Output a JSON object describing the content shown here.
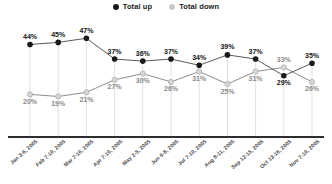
{
  "legend": {
    "items": [
      {
        "label": "Total up",
        "color": "#1a1a1a",
        "marker": "filled-circle-icon"
      },
      {
        "label": "Total down",
        "color": "#c9c9c9",
        "marker": "hollow-circle-icon"
      }
    ]
  },
  "axis": {
    "categories": [
      "Jan 3-6, 2005",
      "Feb 7-10, 2005",
      "Mar 7-10, 2005",
      "Apr 7-10, 2005",
      "May 2-5, 2005",
      "Jun 6-8, 2005",
      "Jul 7-10, 2005",
      "Aug 8-11, 2005",
      "Sep 12-15, 2005",
      "Oct 13-16, 2005",
      "Nov 7-10, 2005"
    ]
  },
  "point_labels": {
    "up": [
      "44%",
      "45%",
      "47%",
      "37%",
      "36%",
      "37%",
      "34%",
      "39%",
      "37%",
      "29%",
      "35%"
    ],
    "down": [
      "20%",
      "19%",
      "21%",
      "27%",
      "30%",
      "26%",
      "31%",
      "25%",
      "31%",
      "33%",
      "26%"
    ]
  },
  "chart_data": {
    "type": "line",
    "title": "",
    "xlabel": "",
    "ylabel": "",
    "ylim": [
      0,
      50
    ],
    "grid": "vertical-only",
    "legend_position": "top-center",
    "value_labels": "percent",
    "categories": [
      "Jan 3-6, 2005",
      "Feb 7-10, 2005",
      "Mar 7-10, 2005",
      "Apr 7-10, 2005",
      "May 2-5, 2005",
      "Jun 6-8, 2005",
      "Jul 7-10, 2005",
      "Aug 8-11, 2005",
      "Sep 12-15, 2005",
      "Oct 13-16, 2005",
      "Nov 7-10, 2005"
    ],
    "series": [
      {
        "name": "Total up",
        "color": "#1a1a1a",
        "values": [
          44,
          45,
          47,
          37,
          36,
          37,
          34,
          39,
          37,
          29,
          35
        ]
      },
      {
        "name": "Total down",
        "color": "#c9c9c9",
        "values": [
          20,
          19,
          21,
          27,
          30,
          26,
          31,
          25,
          31,
          33,
          26
        ]
      }
    ]
  }
}
